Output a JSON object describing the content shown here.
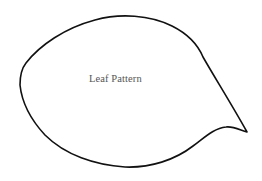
{
  "figure": {
    "label": "Leaf Pattern",
    "outline_color": "#111111",
    "background_color": "#ffffff",
    "label_color": "#555555"
  }
}
